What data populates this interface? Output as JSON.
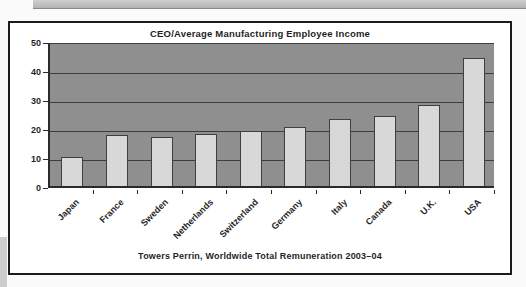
{
  "chart": {
    "title": "CEO/Average Manufacturing Employee Income",
    "caption": "Towers Perrin, Worldwide Total Remuneration 2003–04"
  },
  "chart_data": {
    "type": "bar",
    "title": "CEO/Average Manufacturing Employee Income",
    "caption": "Towers Perrin, Worldwide Total Remuneration 2003–04",
    "categories": [
      "Japan",
      "France",
      "Sweden",
      "Netherlands",
      "Switzerland",
      "Germany",
      "Italy",
      "Canada",
      "U.K.",
      "USA"
    ],
    "values": [
      10,
      17.5,
      17,
      18,
      19,
      20.5,
      23,
      24,
      28,
      44
    ],
    "xlabel": "",
    "ylabel": "",
    "ylim": [
      0,
      50
    ],
    "yticks": [
      0,
      10,
      20,
      30,
      40,
      50
    ],
    "grid": true,
    "legend": "none",
    "colors": {
      "plot_bg": "#8f8f8f",
      "bar_fill": "#d8d8d8",
      "bar_border": "#3f3f3f",
      "gridline": "#3d3d3d",
      "frame_border": "#1c1c1c",
      "header_strip": "#c2c2c2"
    }
  }
}
